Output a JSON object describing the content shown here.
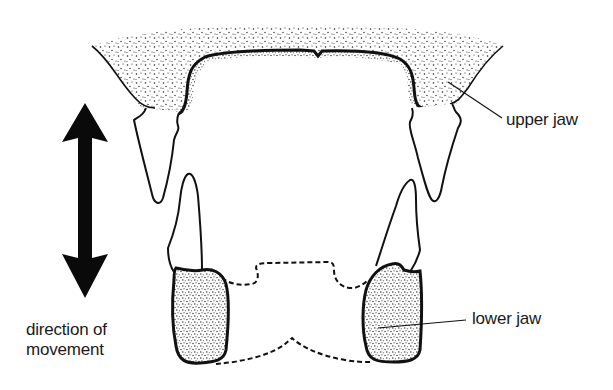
{
  "diagram": {
    "type": "anatomical-illustration",
    "labels": {
      "upper_jaw": "upper jaw",
      "lower_jaw": "lower jaw",
      "direction_line1": "direction of",
      "direction_line2": "movement"
    },
    "arrow": {
      "type": "double-headed vertical",
      "meaning": "direction of movement"
    },
    "colors": {
      "ink": "#111111",
      "background": "#ffffff"
    }
  }
}
